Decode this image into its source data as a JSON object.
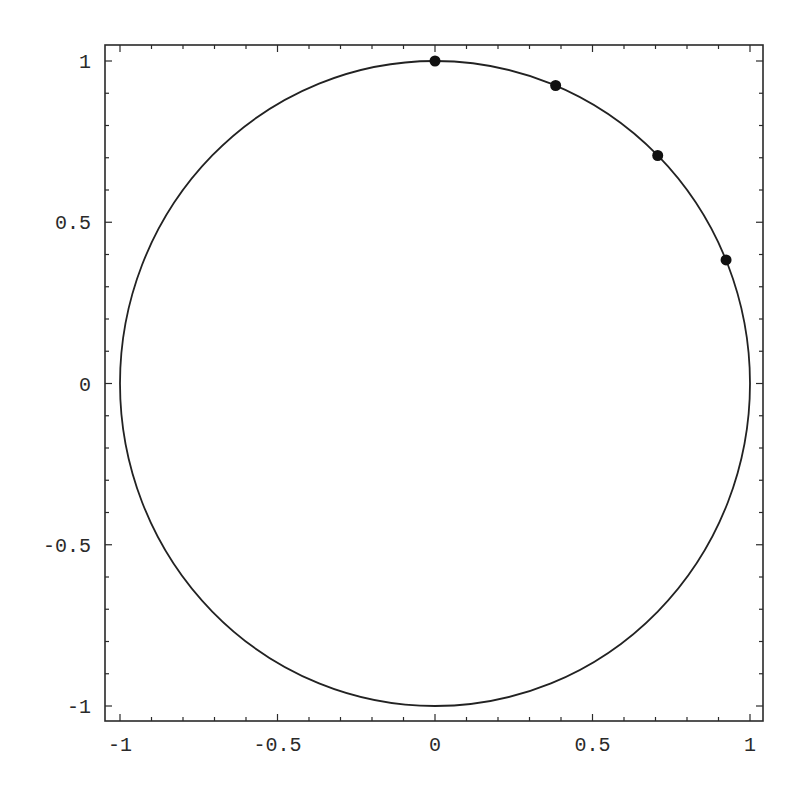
{
  "chart_data": {
    "type": "scatter",
    "title": "",
    "xlabel": "",
    "ylabel": "",
    "xlim": [
      -1.05,
      1.05
    ],
    "ylim": [
      -1.05,
      1.05
    ],
    "grid": false,
    "legend": null,
    "x_ticks": [
      {
        "value": -1,
        "label": "-1"
      },
      {
        "value": -0.5,
        "label": "-0.5"
      },
      {
        "value": 0,
        "label": "0"
      },
      {
        "value": 0.5,
        "label": "0.5"
      },
      {
        "value": 1,
        "label": "1"
      }
    ],
    "y_ticks": [
      {
        "value": 1,
        "label": "1"
      },
      {
        "value": 0.5,
        "label": "0.5"
      },
      {
        "value": 0,
        "label": "0"
      },
      {
        "value": -0.5,
        "label": "-0.5"
      },
      {
        "value": -1,
        "label": "-1"
      }
    ],
    "minor_tick_step": 0.1,
    "series": [
      {
        "name": "unit-circle",
        "kind": "curve",
        "description": "circle x^2 + y^2 = 1",
        "center": [
          0,
          0
        ],
        "radius": 1,
        "color": "#222222"
      },
      {
        "name": "points",
        "kind": "scatter",
        "color": "#111111",
        "x": [
          0.0,
          0.383,
          0.707,
          0.924
        ],
        "y": [
          1.0,
          0.924,
          0.707,
          0.383
        ],
        "angles_deg": [
          90,
          67.5,
          45,
          22.5
        ]
      }
    ]
  },
  "layout": {
    "frame": {
      "left": 105,
      "top": 45,
      "right": 763,
      "bottom": 721
    },
    "x_map": {
      "v_neg1": 120,
      "v_pos1": 750
    },
    "y_map": {
      "v_pos1": 61,
      "v_neg1": 706
    }
  }
}
